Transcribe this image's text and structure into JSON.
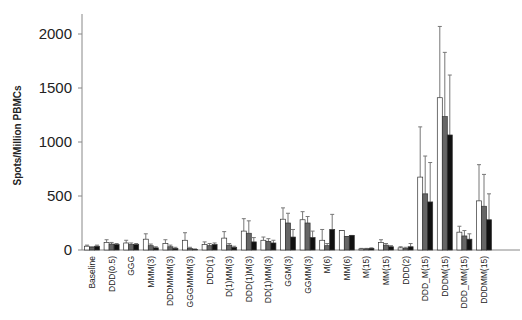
{
  "chart_data": {
    "type": "bar",
    "title": "",
    "xlabel": "",
    "ylabel": "Spots/Million PBMCs",
    "ylim": [
      0,
      2200
    ],
    "yticks": [
      0,
      500,
      1000,
      1500,
      2000
    ],
    "grid": false,
    "legend": null,
    "categories": [
      "Baseline",
      "DDD(0.5)",
      "GGG",
      "MMM(3)",
      "DDDMMM(3)",
      "GGGMMM(3)",
      "DDD(1)",
      "D(1)MM(3)",
      "DDD(1)M(3)",
      "DD(1)MM(3)",
      "GGM(3)",
      "GGMM(3)",
      "M(6)",
      "MM(6)",
      "M(15)",
      "MM(15)",
      "DDD(2)",
      "DDD_M(15)",
      "DDDM(15)",
      "DDD_MM(15)",
      "DDDMM(15)"
    ],
    "series": [
      {
        "name": "series-1",
        "color": "#ffffff",
        "values": [
          35,
          70,
          65,
          100,
          60,
          90,
          50,
          110,
          175,
          90,
          285,
          280,
          90,
          180,
          10,
          70,
          20,
          675,
          1410,
          165,
          455
        ],
        "errors": [
          45,
          95,
          90,
          150,
          95,
          160,
          75,
          170,
          290,
          120,
          390,
          355,
          190,
          180,
          15,
          95,
          30,
          1140,
          2070,
          220,
          790
        ]
      },
      {
        "name": "series-2",
        "color": "#666666",
        "values": [
          25,
          55,
          50,
          40,
          30,
          15,
          40,
          45,
          155,
          80,
          250,
          250,
          40,
          125,
          10,
          45,
          15,
          520,
          1235,
          130,
          405
        ],
        "errors": [
          30,
          70,
          65,
          55,
          45,
          25,
          60,
          60,
          270,
          105,
          340,
          310,
          60,
          125,
          15,
          60,
          25,
          870,
          1830,
          180,
          700
        ]
      },
      {
        "name": "series-3",
        "color": "#111111",
        "values": [
          35,
          50,
          50,
          20,
          15,
          5,
          50,
          25,
          75,
          65,
          120,
          115,
          190,
          135,
          15,
          30,
          30,
          445,
          1065,
          100,
          280
        ],
        "errors": [
          45,
          60,
          60,
          30,
          25,
          10,
          65,
          35,
          115,
          90,
          190,
          175,
          330,
          135,
          20,
          40,
          60,
          810,
          1620,
          150,
          520
        ]
      }
    ]
  }
}
